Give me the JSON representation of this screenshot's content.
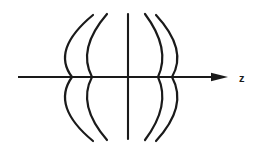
{
  "figure": {
    "background_color": "#ffffff",
    "stroke_color": "#1a1a1a",
    "width": 259,
    "height": 155
  },
  "axis": {
    "name": "z-axis",
    "label": "z",
    "label_x": 239,
    "label_y": 82,
    "label_font_size": 11,
    "start_x": 18,
    "end_x": 228,
    "y": 77,
    "stroke_width": 2.1,
    "arrowhead": {
      "name": "arrowhead",
      "tip_x": 228,
      "tip_y": 77,
      "back_x": 211,
      "half_height": 4.2
    }
  },
  "chart_data": {
    "type": "line",
    "xlabel": "z",
    "ylabel": "",
    "grid": false,
    "legend": "none",
    "axis_crossings_x": [
      72,
      92,
      128,
      158,
      172
    ],
    "curves": [
      {
        "name": "wavefront-outer-left",
        "top_x": 93,
        "top_y": 15,
        "vertex_x": 72,
        "vertex_y": 77,
        "bottom_x": 93,
        "bottom_y": 141,
        "bow_direction": "left",
        "stroke_width": 2.2
      },
      {
        "name": "wavefront-inner-left",
        "top_x": 107,
        "top_y": 14,
        "vertex_x": 92,
        "vertex_y": 77,
        "bottom_x": 107,
        "bottom_y": 140,
        "bow_direction": "left",
        "stroke_width": 2.2
      },
      {
        "name": "wavefront-center",
        "top_x": 128,
        "top_y": 14,
        "vertex_x": 128,
        "vertex_y": 77,
        "bottom_x": 128,
        "bottom_y": 139,
        "bow_direction": "straight",
        "stroke_width": 2.1
      },
      {
        "name": "wavefront-inner-right",
        "top_x": 145,
        "top_y": 14,
        "vertex_x": 158,
        "vertex_y": 77,
        "bottom_x": 145,
        "bottom_y": 140,
        "bow_direction": "right",
        "stroke_width": 2.2
      },
      {
        "name": "wavefront-outer-right",
        "top_x": 156,
        "top_y": 15,
        "vertex_x": 172,
        "vertex_y": 77,
        "bottom_x": 156,
        "bottom_y": 141,
        "bow_direction": "right",
        "stroke_width": 2.2
      }
    ]
  }
}
